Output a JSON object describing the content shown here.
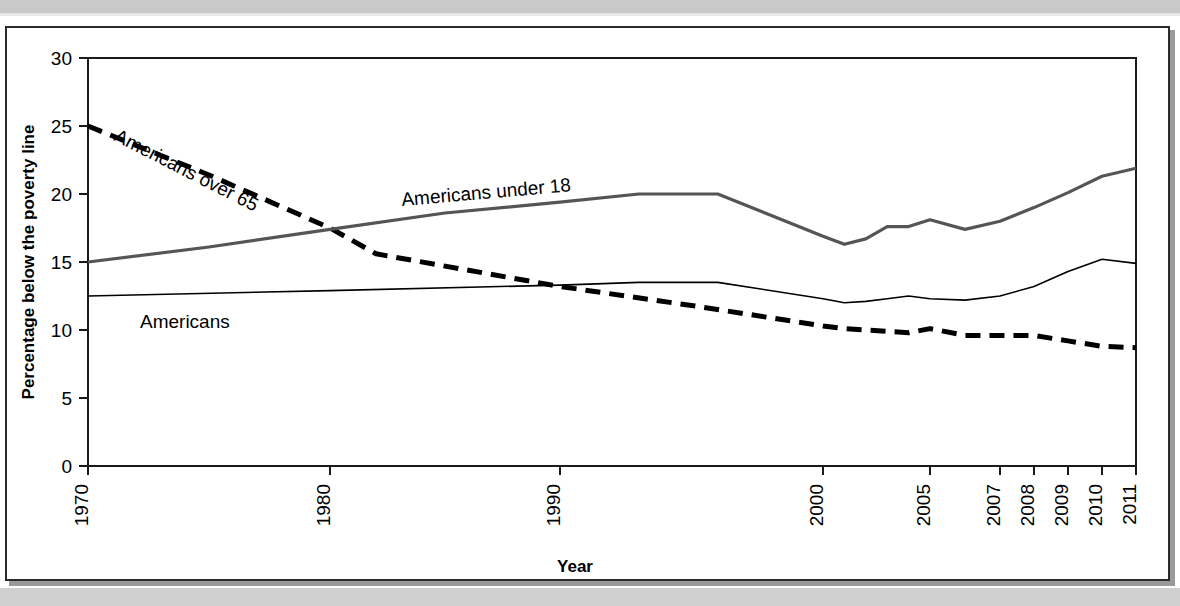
{
  "chart_data": {
    "type": "line",
    "title": "",
    "xlabel": "Year",
    "ylabel": "Percentage below the poverty line",
    "xlim": [
      1970,
      2011
    ],
    "ylim": [
      0,
      30
    ],
    "grid": false,
    "legend_position": "inline-labels",
    "y_ticks": [
      "0",
      "5",
      "10",
      "15",
      "20",
      "25",
      "30"
    ],
    "y_tick_values": [
      0,
      5,
      10,
      15,
      20,
      25,
      30
    ],
    "x_ticks": [
      "1970",
      "1980",
      "1990",
      "2000",
      "2005",
      "2007",
      "2008",
      "2009",
      "2010",
      "2011"
    ],
    "x_tick_values": [
      1970,
      1980,
      1990,
      2000,
      2005,
      2007,
      2008,
      2009,
      2010,
      2011
    ],
    "series": [
      {
        "name": "Americans over 65",
        "style": "dashed",
        "color": "#000000",
        "x": [
          1970,
          1975,
          1980,
          1982,
          1985,
          1990,
          1995,
          2000,
          2001,
          2002,
          2003,
          2004,
          2005,
          2006,
          2007,
          2008,
          2009,
          2010,
          2011
        ],
        "values": [
          25.0,
          21.4,
          17.5,
          15.6,
          14.7,
          13.2,
          11.8,
          10.3,
          10.1,
          10.0,
          9.9,
          9.8,
          10.1,
          9.6,
          9.6,
          9.6,
          9.2,
          8.8,
          8.7
        ]
      },
      {
        "name": "Americans under 18",
        "style": "solid-thick",
        "color": "#555555",
        "x": [
          1970,
          1975,
          1980,
          1985,
          1990,
          1993,
          1996,
          2000,
          2001,
          2002,
          2003,
          2004,
          2005,
          2006,
          2007,
          2008,
          2009,
          2010,
          2011
        ],
        "values": [
          15.0,
          16.1,
          17.4,
          18.6,
          19.4,
          20.0,
          20.0,
          16.9,
          16.3,
          16.7,
          17.6,
          17.6,
          18.1,
          17.4,
          18.0,
          19.0,
          20.1,
          21.3,
          21.9
        ]
      },
      {
        "name": "Americans",
        "style": "solid-thin",
        "color": "#000000",
        "x": [
          1970,
          1980,
          1990,
          1993,
          1996,
          2000,
          2001,
          2002,
          2003,
          2004,
          2005,
          2006,
          2007,
          2008,
          2009,
          2010,
          2011
        ],
        "values": [
          12.5,
          12.9,
          13.3,
          13.5,
          13.5,
          12.3,
          12.0,
          12.1,
          12.3,
          12.5,
          12.3,
          12.2,
          12.5,
          13.2,
          14.3,
          15.2,
          14.9
        ]
      }
    ],
    "inline_labels": [
      {
        "text": "Americans over 65",
        "rotation": 27
      },
      {
        "text": "Americans under 18",
        "rotation": -5
      },
      {
        "text": "Americans",
        "rotation": 0
      }
    ]
  }
}
